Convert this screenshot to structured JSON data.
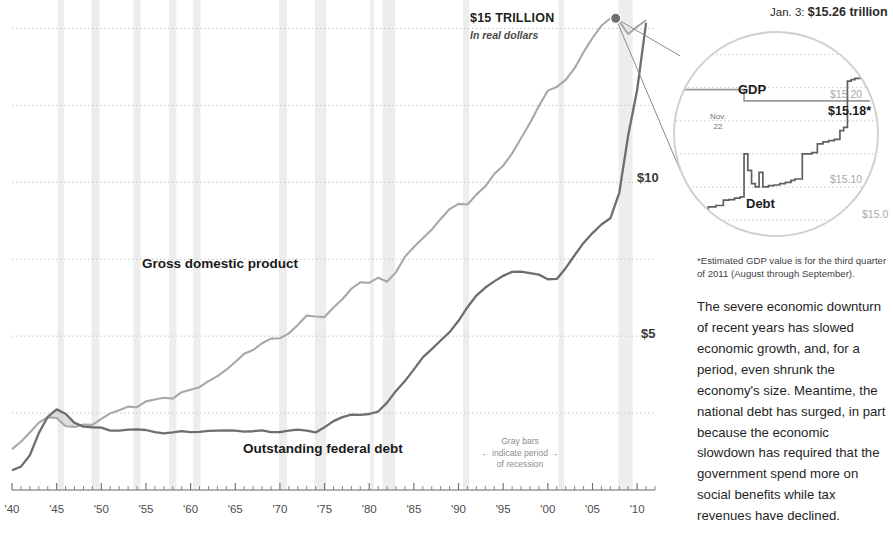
{
  "chart_data": {
    "type": "line",
    "title": "$15 TRILLION",
    "subtitle": "In real dollars",
    "xlabel": "",
    "ylabel": "",
    "xlim": [
      1940,
      2012
    ],
    "ylim": [
      0,
      15.6
    ],
    "grid": true,
    "gridlines": [
      2.5,
      5,
      7.5,
      10,
      12.5,
      15
    ],
    "y_tick_labels": [
      "$10",
      "$5"
    ],
    "y_tick_values": [
      10,
      5
    ],
    "x_tick_labels": [
      "'40",
      "'45",
      "'50",
      "'55",
      "'60",
      "'65",
      "'70",
      "'75",
      "'80",
      "'85",
      "'90",
      "'95",
      "'00",
      "'05",
      "'10"
    ],
    "x_tick_values": [
      1940,
      1945,
      1950,
      1955,
      1960,
      1965,
      1970,
      1975,
      1980,
      1985,
      1990,
      1995,
      2000,
      2005,
      2010
    ],
    "legend_position": "inline-annotations",
    "series": [
      {
        "name": "Gross domestic product",
        "color": "#a8a8a8",
        "x": [
          1940,
          1941,
          1942,
          1943,
          1944,
          1945,
          1946,
          1947,
          1948,
          1949,
          1950,
          1951,
          1952,
          1953,
          1954,
          1955,
          1956,
          1957,
          1958,
          1959,
          1960,
          1961,
          1962,
          1963,
          1964,
          1965,
          1966,
          1967,
          1968,
          1969,
          1970,
          1971,
          1972,
          1973,
          1974,
          1975,
          1976,
          1977,
          1978,
          1979,
          1980,
          1981,
          1982,
          1983,
          1984,
          1985,
          1986,
          1987,
          1988,
          1989,
          1990,
          1991,
          1992,
          1993,
          1994,
          1995,
          1996,
          1997,
          1998,
          1999,
          2000,
          2001,
          2002,
          2003,
          2004,
          2005,
          2006,
          2007,
          2008,
          2009,
          2010,
          2011
        ],
        "values": [
          1.33,
          1.57,
          1.87,
          2.19,
          2.36,
          2.34,
          2.07,
          2.05,
          2.13,
          2.12,
          2.31,
          2.49,
          2.59,
          2.71,
          2.69,
          2.88,
          2.94,
          3.0,
          2.97,
          3.18,
          3.26,
          3.34,
          3.54,
          3.7,
          3.91,
          4.16,
          4.43,
          4.55,
          4.77,
          4.92,
          4.93,
          5.09,
          5.36,
          5.67,
          5.64,
          5.62,
          5.93,
          6.2,
          6.54,
          6.75,
          6.73,
          6.9,
          6.77,
          7.08,
          7.58,
          7.9,
          8.18,
          8.46,
          8.81,
          9.13,
          9.3,
          9.28,
          9.6,
          9.87,
          10.27,
          10.54,
          10.94,
          11.43,
          11.93,
          12.48,
          12.98,
          13.1,
          13.33,
          13.71,
          14.23,
          14.69,
          15.09,
          15.33,
          15.23,
          14.82,
          15.06,
          15.26
        ],
        "label_text": "Gross domestic product"
      },
      {
        "name": "Outstanding federal debt",
        "color": "#6e6e6e",
        "x": [
          1940,
          1941,
          1942,
          1943,
          1944,
          1945,
          1946,
          1947,
          1948,
          1949,
          1950,
          1951,
          1952,
          1953,
          1954,
          1955,
          1956,
          1957,
          1958,
          1959,
          1960,
          1961,
          1962,
          1963,
          1964,
          1965,
          1966,
          1967,
          1968,
          1969,
          1970,
          1971,
          1972,
          1973,
          1974,
          1975,
          1976,
          1977,
          1978,
          1979,
          1980,
          1981,
          1982,
          1983,
          1984,
          1985,
          1986,
          1987,
          1988,
          1989,
          1990,
          1991,
          1992,
          1993,
          1994,
          1995,
          1996,
          1997,
          1998,
          1999,
          2000,
          2001,
          2002,
          2003,
          2004,
          2005,
          2006,
          2007,
          2008,
          2009,
          2010,
          2011
        ],
        "values": [
          0.64,
          0.76,
          1.13,
          1.85,
          2.38,
          2.62,
          2.48,
          2.18,
          2.06,
          2.04,
          2.03,
          1.93,
          1.93,
          1.96,
          1.97,
          1.95,
          1.88,
          1.84,
          1.87,
          1.91,
          1.88,
          1.89,
          1.92,
          1.93,
          1.94,
          1.93,
          1.9,
          1.91,
          1.94,
          1.88,
          1.88,
          1.93,
          1.96,
          1.93,
          1.87,
          2.04,
          2.24,
          2.37,
          2.45,
          2.44,
          2.47,
          2.55,
          2.84,
          3.22,
          3.54,
          3.92,
          4.31,
          4.58,
          4.86,
          5.13,
          5.5,
          5.94,
          6.32,
          6.58,
          6.78,
          6.96,
          7.09,
          7.1,
          7.05,
          7.0,
          6.85,
          6.86,
          7.21,
          7.63,
          8.03,
          8.35,
          8.63,
          8.83,
          9.66,
          11.53,
          13.0,
          15.18
        ],
        "label_text": "Outstanding federal debt"
      }
    ],
    "recession_bands": [
      [
        1945.1,
        1945.8
      ],
      [
        1948.9,
        1949.8
      ],
      [
        1953.6,
        1954.4
      ],
      [
        1957.6,
        1958.4
      ],
      [
        1960.3,
        1961.1
      ],
      [
        1969.9,
        1970.8
      ],
      [
        1973.9,
        1975.2
      ],
      [
        1980.1,
        1980.5
      ],
      [
        1981.5,
        1982.9
      ],
      [
        1990.5,
        1991.2
      ],
      [
        2001.2,
        2001.8
      ],
      [
        2007.9,
        2009.5
      ]
    ],
    "recession_note": "Gray bars\nindicate period\nof recession",
    "crossover_shading": "Debt exceeded GDP during World War II (1944-1946)"
  },
  "chart": {
    "trillion_label": "$15 TRILLION",
    "trillion_sub": "In real dollars",
    "y_tick_10": "$10",
    "y_tick_5": "$5",
    "gdp_label": "Gross domestic\nproduct",
    "debt_label": "Outstanding federal debt",
    "recession_line1": "Gray bars",
    "recession_line2": "indicate period",
    "recession_line3": "of recession",
    "recession_arrow_left": "←",
    "recession_arrow_right": "→",
    "x_ticks": [
      "'40",
      "'45",
      "'50",
      "'55",
      "'60",
      "'65",
      "'70",
      "'75",
      "'80",
      "'85",
      "'90",
      "'95",
      "'00",
      "'05",
      "'10"
    ]
  },
  "inset": {
    "callout_prefix": "Jan. 3: ",
    "callout_value": "$15.26 trillion",
    "gdp_label": "GDP",
    "debt_label": "Debt",
    "nov_label": "Nov.\n22",
    "nov_line1": "Nov.",
    "nov_line2": "22",
    "value_1520": "$15.20",
    "value_1518": "$15.18*",
    "value_1510": "$15.10",
    "value_1500": "$15.0",
    "inset_data": {
      "gdp_value": 15.18,
      "debt_end_value": 15.26,
      "gridline_values": [
        15.25,
        15.2,
        15.15,
        15.1,
        15.05,
        15.0
      ],
      "debt_x": [
        0,
        4,
        7,
        10,
        14,
        18,
        22,
        25,
        28,
        31,
        33,
        35,
        37,
        39,
        41,
        43,
        46,
        49,
        52,
        55,
        58,
        60,
        62,
        64,
        66,
        69,
        72,
        75,
        78,
        81,
        84,
        86,
        88,
        90,
        92,
        95,
        98,
        100
      ],
      "debt_y": [
        15.003,
        15.003,
        15.012,
        15.016,
        15.02,
        15.022,
        15.03,
        15.031,
        15.033,
        15.035,
        15.1,
        15.075,
        15.055,
        15.05,
        15.072,
        15.05,
        15.052,
        15.053,
        15.055,
        15.057,
        15.06,
        15.062,
        15.062,
        15.1,
        15.1,
        15.102,
        15.115,
        15.118,
        15.12,
        15.122,
        15.135,
        15.14,
        15.21,
        15.212,
        15.214,
        15.24,
        15.26,
        15.26
      ],
      "gdp_x": [
        0,
        30,
        33,
        100
      ],
      "gdp_y": [
        15.197,
        15.197,
        15.18,
        15.18
      ]
    }
  },
  "sidebar": {
    "footnote": "*Estimated GDP value is for the third quarter of 2011 (August through September).",
    "body": "The severe economic downturn of recent years has slowed economic growth, and, for a period, even shrunk the economy's size. Meantime, the national debt has surged, in part because the economic slowdown has required that the government spend more on social benefits while tax revenues have declined."
  },
  "colors": {
    "gdp_line": "#a8a8a8",
    "debt_line": "#6e6e6e",
    "recession_band": "#ededed",
    "gridline": "#c9c9c9",
    "axis": "#6b6b6b",
    "text": "#231f20"
  }
}
